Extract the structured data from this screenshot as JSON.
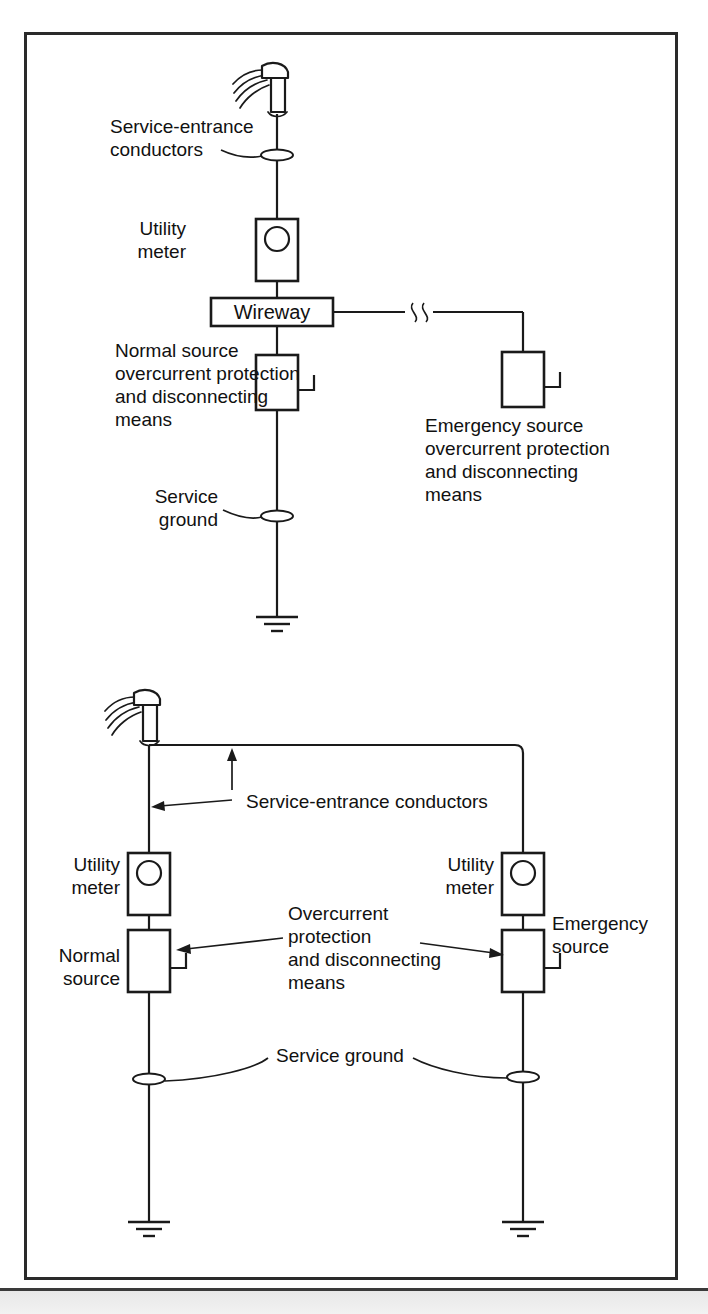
{
  "figure": {
    "title_text": "",
    "type": "electrical one-line diagram",
    "frame_color": "#2a2a2a",
    "line_color": "#1a1a1a",
    "background": "#ffffff"
  },
  "diagram_top": {
    "labels": {
      "service_entrance_conductors_line1": "Service-entrance",
      "service_entrance_conductors_line2": "conductors",
      "utility_meter_line1": "Utility",
      "utility_meter_line2": "meter",
      "wireway": "Wireway",
      "normal_source_line1": "Normal source",
      "normal_source_line2": "overcurrent protection",
      "normal_source_line3": "and disconnecting",
      "normal_source_line4": "means",
      "emergency_source_line1": "Emergency source",
      "emergency_source_line2": "overcurrent protection",
      "emergency_source_line3": "and disconnecting",
      "emergency_source_line4": "means",
      "service_ground_line1": "Service",
      "service_ground_line2": "ground"
    },
    "icons": {
      "weatherhead": "service-head-icon",
      "meter": "utility-meter-icon",
      "breaker": "circuit-breaker-icon",
      "ground": "earth-ground-icon",
      "bushing": "service-ground-bushing-icon",
      "break": "wire-break-icon"
    }
  },
  "diagram_bottom": {
    "labels": {
      "service_entrance_conductors": "Service-entrance conductors",
      "utility_meter_left_line1": "Utility",
      "utility_meter_left_line2": "meter",
      "utility_meter_right_line1": "Utility",
      "utility_meter_right_line2": "meter",
      "normal_source_line1": "Normal",
      "normal_source_line2": "source",
      "emergency_source_line1": "Emergency",
      "emergency_source_line2": "source",
      "overcurrent_line1": "Overcurrent",
      "overcurrent_line2": "protection",
      "overcurrent_line3": "and disconnecting",
      "overcurrent_line4": "means",
      "service_ground": "Service ground"
    },
    "icons": {
      "weatherhead": "service-head-icon",
      "meter": "utility-meter-icon",
      "breaker": "circuit-breaker-icon",
      "ground": "earth-ground-icon",
      "bushing": "service-ground-bushing-icon"
    }
  }
}
